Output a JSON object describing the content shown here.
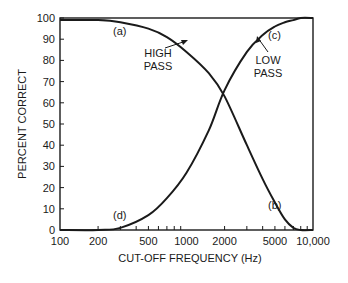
{
  "chart_data": {
    "type": "line",
    "title": "",
    "xlabel": "CUT-OFF FREQUENCY (Hz)",
    "ylabel": "PERCENT CORRECT",
    "xscale": "log",
    "xlim": [
      100,
      10000
    ],
    "ylim": [
      0,
      100
    ],
    "grid": false,
    "legend": "none (inline annotations)",
    "x_tick_labels": [
      "100",
      "200",
      "500",
      "1000",
      "2000",
      "5000",
      "10,000"
    ],
    "x_tick_values": [
      100,
      200,
      500,
      1000,
      2000,
      5000,
      10000
    ],
    "y_tick_labels": [
      "0",
      "10",
      "20",
      "30",
      "40",
      "50",
      "60",
      "70",
      "80",
      "90",
      "100"
    ],
    "series": [
      {
        "name": "HIGH PASS",
        "x": [
          100,
          200,
          300,
          500,
          700,
          1000,
          1500,
          2000,
          3000,
          4000,
          5000,
          6000,
          7000,
          8000,
          10000
        ],
        "values": [
          99,
          99,
          98,
          95,
          91,
          84,
          74,
          63,
          40,
          24,
          13,
          5,
          1,
          0,
          0
        ]
      },
      {
        "name": "LOW PASS",
        "x": [
          100,
          200,
          300,
          500,
          700,
          1000,
          1500,
          2000,
          3000,
          4000,
          5000,
          6000,
          7000,
          8000,
          10000
        ],
        "values": [
          0,
          0,
          1,
          7,
          15,
          27,
          47,
          66,
          84,
          92,
          96,
          98,
          99,
          100,
          100
        ]
      }
    ],
    "annotations": [
      {
        "text": "(a)",
        "x": 140,
        "y": 97
      },
      {
        "text": "HIGH PASS",
        "x": 500,
        "y": 82,
        "arrow_to": [
          1100,
          90
        ]
      },
      {
        "text": "(b)",
        "x": 4800,
        "y": 8
      },
      {
        "text": "(c)",
        "x": 4700,
        "y": 95
      },
      {
        "text": "LOW PASS",
        "x": 4200,
        "y": 82,
        "arrow_to": [
          3300,
          92
        ]
      },
      {
        "text": "(d)",
        "x": 300,
        "y": 7
      }
    ]
  },
  "labels": {
    "xlabel": "CUT-OFF FREQUENCY (Hz)",
    "ylabel": "PERCENT CORRECT",
    "a": "(a)",
    "b": "(b)",
    "c": "(c)",
    "d": "(d)",
    "high_pass_1": "HIGH",
    "high_pass_2": "PASS",
    "low_pass_1": "LOW",
    "low_pass_2": "PASS"
  },
  "colors": {
    "ink": "#1a1a1a",
    "background": "#ffffff"
  }
}
